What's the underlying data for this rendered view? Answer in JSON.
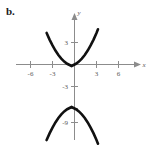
{
  "figure": {
    "part_label": "b.",
    "background_color": "#ffffff",
    "axis_color": "#8c8c8c",
    "curve_color": "#111111",
    "label_color": "#5a5a5a"
  },
  "chart_data": {
    "type": "line",
    "title": "",
    "xlabel": "x",
    "ylabel": "y",
    "xlim": [
      -7.6,
      8.2
    ],
    "ylim": [
      -11.5,
      4.8
    ],
    "grid": false,
    "legend": null,
    "x_tick_labels": [
      "-6",
      "-3",
      "3",
      "6"
    ],
    "x_ticks": [
      -6,
      -3,
      3,
      6
    ],
    "y_tick_labels": [
      "3",
      "-3",
      "-9"
    ],
    "y_ticks_labeled": [
      3,
      -3,
      -9
    ],
    "y_ticks_all": [
      3,
      -3,
      -6,
      -9
    ],
    "series": [
      {
        "name": "upper-branch",
        "description": "upward-opening parabola, vertex near (-0.4, -0.2)",
        "x": [
          -3.8,
          -3.4,
          -3.0,
          -2.6,
          -2.2,
          -1.8,
          -1.4,
          -1.0,
          -0.6,
          -0.4,
          -0.2,
          0.2,
          0.6,
          1.0,
          1.4,
          1.8,
          2.2,
          2.6,
          3.0,
          3.2
        ],
        "y": [
          4.3,
          3.4,
          2.6,
          1.9,
          1.3,
          0.8,
          0.4,
          0.1,
          -0.1,
          -0.2,
          -0.1,
          0.1,
          0.4,
          0.8,
          1.3,
          1.9,
          2.6,
          3.4,
          4.3,
          4.8
        ]
      },
      {
        "name": "lower-branch",
        "description": "downward-opening parabola, vertex near (-0.4, -5.8)",
        "x": [
          -3.8,
          -3.4,
          -3.0,
          -2.6,
          -2.2,
          -1.8,
          -1.4,
          -1.0,
          -0.6,
          -0.4,
          -0.2,
          0.2,
          0.6,
          1.0,
          1.4,
          1.8,
          2.2,
          2.6,
          3.0,
          3.2
        ],
        "y": [
          -10.3,
          -9.4,
          -8.6,
          -7.9,
          -7.3,
          -6.8,
          -6.4,
          -6.1,
          -5.9,
          -5.8,
          -5.9,
          -6.1,
          -6.4,
          -6.8,
          -7.3,
          -7.9,
          -8.6,
          -9.4,
          -10.3,
          -10.8
        ]
      }
    ],
    "annotations": []
  }
}
